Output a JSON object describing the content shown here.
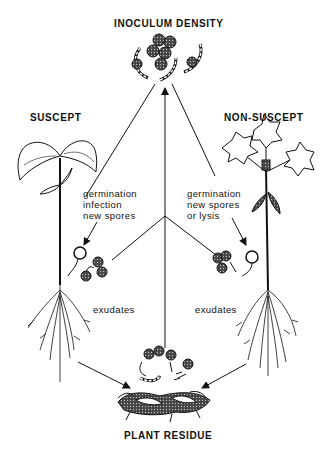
{
  "diagram": {
    "title_top": "INOCULUM DENSITY",
    "title_bottom": "PLANT RESIDUE",
    "left_plant_label": "SUSCEPT",
    "right_plant_label": "NON-SUSCEPT",
    "left_process_note": "germination\ninfection\nnew spores",
    "right_process_note": "germination\nnew spores\nor lysis",
    "left_exudates": "exudates",
    "right_exudates": "exudates",
    "nodes": [
      {
        "id": "inoculum",
        "label": "INOCULUM DENSITY",
        "icon": "spore-cluster-icon"
      },
      {
        "id": "suscept",
        "label": "SUSCEPT",
        "icon": "seedling-plant-icon"
      },
      {
        "id": "non_suscept",
        "label": "NON-SUSCEPT",
        "icon": "lobed-leaf-plant-icon"
      },
      {
        "id": "residue",
        "label": "PLANT RESIDUE",
        "icon": "residue-debris-icon"
      }
    ],
    "edges": [
      {
        "from": "junction",
        "to": "inoculum",
        "style": "arrow"
      },
      {
        "from": "suscept_spores",
        "to": "junction",
        "style": "line"
      },
      {
        "from": "non_suscept_spores",
        "to": "junction",
        "style": "line"
      },
      {
        "from": "residue",
        "to": "junction",
        "style": "line"
      },
      {
        "from": "inoculum",
        "to": "suscept_spores",
        "style": "arrow",
        "label": "germination infection new spores"
      },
      {
        "from": "inoculum",
        "to": "non_suscept_spores",
        "style": "arrow",
        "label": "germination new spores or lysis"
      },
      {
        "from": "suscept",
        "to": "residue",
        "style": "arrow"
      },
      {
        "from": "non_suscept",
        "to": "residue",
        "style": "arrow"
      }
    ]
  }
}
